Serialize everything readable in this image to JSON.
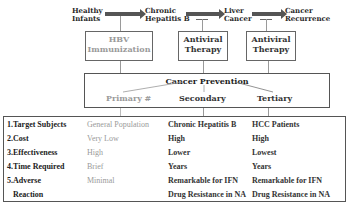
{
  "flow": {
    "stages": [
      {
        "line1": "Healthy",
        "line2": "Infants"
      },
      {
        "line1": "Chronic",
        "line2": "Hepatitis B"
      },
      {
        "line1": "Liver",
        "line2": "Cancer"
      },
      {
        "line1": "Cancer",
        "line2": "Recurrence"
      }
    ],
    "interventions": [
      {
        "line1": "HBV",
        "line2": "Immunization"
      },
      {
        "line1": "Antiviral",
        "line2": "Therapy"
      },
      {
        "line1": "Antiviral",
        "line2": "Therapy"
      }
    ]
  },
  "prevention": {
    "title": "Cancer Prevention",
    "levels": [
      "Primary #",
      "Secondary",
      "Tertiary"
    ]
  },
  "table": {
    "rows": [
      {
        "label": "1.Target Subjects",
        "primary": "General Population",
        "secondary": "Chronic Hepatitis B",
        "tertiary": "HCC Patients"
      },
      {
        "label": "2.Cost",
        "primary": "Very Low",
        "secondary": "High",
        "tertiary": "High"
      },
      {
        "label": "3.Effectiveness",
        "primary": "High",
        "secondary": "Lower",
        "tertiary": "Lowest"
      },
      {
        "label": "4.Time Required",
        "primary": "Brief",
        "secondary": "Years",
        "tertiary": "Years"
      },
      {
        "label": "5.Adverse",
        "primary": "Minimal",
        "secondary": "Remarkable for IFN",
        "tertiary": "Remarkable for IFN"
      },
      {
        "label": " Reaction",
        "primary": "",
        "secondary": "Drug Resistance in NA",
        "tertiary": "Drug Resistance in NA"
      }
    ]
  },
  "colors": {
    "primary_text": "#9a9a9a",
    "dark_text": "#333333",
    "arrow": "#555555",
    "border": "#555555"
  }
}
